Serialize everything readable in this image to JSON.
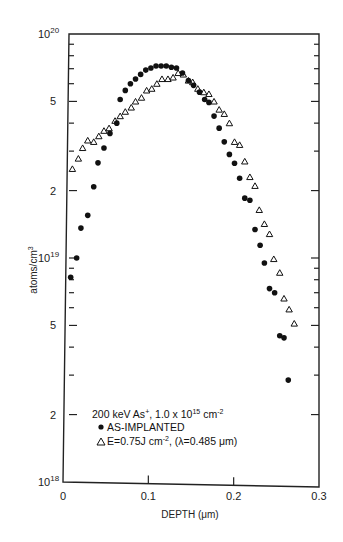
{
  "chart_data": {
    "type": "scatter",
    "title": "",
    "xlabel": "DEPTH (μm)",
    "ylabel": "atoms/cm3",
    "xlim": [
      0,
      0.3
    ],
    "ylim": [
      1e+18,
      1e+20
    ],
    "yscale": "log",
    "grid": false,
    "x_ticks": [
      "0",
      "0.1",
      "0.2",
      "0.3"
    ],
    "y_tick_labels": [
      {
        "value": 1e+20,
        "label": "10",
        "exp": "20"
      },
      {
        "value": 5e+19,
        "label": "5",
        "exp": ""
      },
      {
        "value": 2e+19,
        "label": "2",
        "exp": ""
      },
      {
        "value": 1e+19,
        "label": "10",
        "exp": "19"
      },
      {
        "value": 5e+18,
        "label": "5",
        "exp": ""
      },
      {
        "value": 2e+18,
        "label": "2",
        "exp": ""
      },
      {
        "value": 1e+18,
        "label": "10",
        "exp": "18"
      }
    ],
    "legend": {
      "header": "200 keV As+, 1.0 x 10^15 cm^-2",
      "position": "lower-left inside"
    },
    "series": [
      {
        "name": "AS-IMPLANTED",
        "marker": "filled-circle",
        "points": [
          [
            0.009,
            8.2e+18
          ],
          [
            0.016,
            1e+19
          ],
          [
            0.021,
            1.36e+19
          ],
          [
            0.029,
            1.55e+19
          ],
          [
            0.036,
            2.08e+19
          ],
          [
            0.041,
            2.66e+19
          ],
          [
            0.048,
            3.1e+19
          ],
          [
            0.055,
            3.6e+19
          ],
          [
            0.063,
            4e+19
          ],
          [
            0.067,
            5.1e+19
          ],
          [
            0.073,
            5.6e+19
          ],
          [
            0.079,
            6e+19
          ],
          [
            0.085,
            6.3e+19
          ],
          [
            0.091,
            6.6e+19
          ],
          [
            0.097,
            6.9e+19
          ],
          [
            0.103,
            7.05e+19
          ],
          [
            0.109,
            7.2e+19
          ],
          [
            0.115,
            7.2e+19
          ],
          [
            0.121,
            7.2e+19
          ],
          [
            0.127,
            7.1e+19
          ],
          [
            0.133,
            7.05e+19
          ],
          [
            0.14,
            6.7e+19
          ],
          [
            0.147,
            6.2e+19
          ],
          [
            0.153,
            5.9e+19
          ],
          [
            0.16,
            5.5e+19
          ],
          [
            0.166,
            5.1e+19
          ],
          [
            0.171,
            4.95e+19
          ],
          [
            0.177,
            4.3e+19
          ],
          [
            0.183,
            3.8e+19
          ],
          [
            0.189,
            3.3e+19
          ],
          [
            0.195,
            2.9e+19
          ],
          [
            0.201,
            2.65e+19
          ],
          [
            0.207,
            2.27e+19
          ],
          [
            0.213,
            1.85e+19
          ],
          [
            0.219,
            1.81e+19
          ],
          [
            0.225,
            1.34e+19
          ],
          [
            0.231,
            1.14e+19
          ],
          [
            0.236,
            9.5e+18
          ],
          [
            0.242,
            7.3e+18
          ],
          [
            0.248,
            7e+18
          ],
          [
            0.254,
            4.5e+18
          ],
          [
            0.259,
            4.4e+18
          ],
          [
            0.264,
            2.85e+18
          ]
        ]
      },
      {
        "name": "E=0.75J cm-2, (λ=0.485 μm)",
        "marker": "open-triangle",
        "points": [
          [
            0.011,
            2.5e+19
          ],
          [
            0.018,
            2.78e+19
          ],
          [
            0.023,
            3.1e+19
          ],
          [
            0.029,
            3.35e+19
          ],
          [
            0.036,
            3.3e+19
          ],
          [
            0.042,
            3.5e+19
          ],
          [
            0.048,
            3.7e+19
          ],
          [
            0.054,
            3.8e+19
          ],
          [
            0.061,
            4.1e+19
          ],
          [
            0.067,
            4.3e+19
          ],
          [
            0.073,
            4.5e+19
          ],
          [
            0.08,
            4.7e+19
          ],
          [
            0.085,
            5e+19
          ],
          [
            0.092,
            5.2e+19
          ],
          [
            0.098,
            5.6e+19
          ],
          [
            0.104,
            5.7e+19
          ],
          [
            0.11,
            6e+19
          ],
          [
            0.116,
            6.3e+19
          ],
          [
            0.123,
            6.3e+19
          ],
          [
            0.129,
            6.4e+19
          ],
          [
            0.135,
            6.7e+19
          ],
          [
            0.141,
            6.6e+19
          ],
          [
            0.147,
            6.2e+19
          ],
          [
            0.152,
            6.1e+19
          ],
          [
            0.158,
            5.7e+19
          ],
          [
            0.165,
            5.5e+19
          ],
          [
            0.171,
            5.4e+19
          ],
          [
            0.177,
            5e+19
          ],
          [
            0.183,
            4.6e+19
          ],
          [
            0.189,
            4.4e+19
          ],
          [
            0.195,
            4e+19
          ],
          [
            0.201,
            3.3e+19
          ],
          [
            0.207,
            3.2e+19
          ],
          [
            0.213,
            2.7e+19
          ],
          [
            0.219,
            2.3e+19
          ],
          [
            0.225,
            2.1e+19
          ],
          [
            0.23,
            1.64e+19
          ],
          [
            0.236,
            1.42e+19
          ],
          [
            0.242,
            1.28e+19
          ],
          [
            0.247,
            9.9e+18
          ],
          [
            0.254,
            8.6e+18
          ],
          [
            0.259,
            6.6e+18
          ],
          [
            0.265,
            5.9e+18
          ],
          [
            0.271,
            5.1e+18
          ]
        ]
      }
    ]
  },
  "labels": {
    "y_axis": "atoms/cm",
    "y_axis_sup": "3",
    "x_axis": "DEPTH (μm)",
    "legend_header": "200 keV As",
    "legend_header_sup": "+",
    "legend_header_rest": ", 1.0 x 10",
    "legend_header_exp": "15",
    "legend_header_unit": " cm",
    "legend_header_unit_exp": "-2",
    "legend_series1": "AS-IMPLANTED",
    "legend_series2a": "E=0.75J cm",
    "legend_series2_exp": "-2",
    "legend_series2b": ", (λ=0.485 μm)"
  }
}
